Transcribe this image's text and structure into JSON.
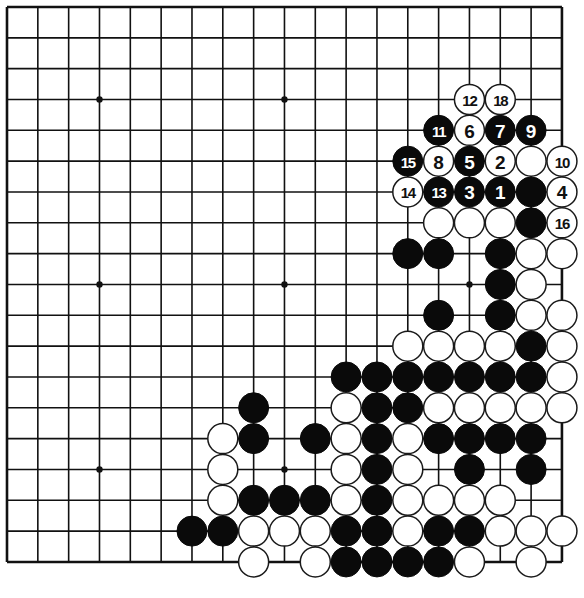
{
  "board": {
    "size": 19,
    "origin_x": 7,
    "origin_y": 7,
    "spacing": 30.83,
    "stone_radius": 15,
    "star_points": [
      [
        3,
        3
      ],
      [
        9,
        3
      ],
      [
        15,
        3
      ],
      [
        3,
        9
      ],
      [
        9,
        9
      ],
      [
        15,
        9
      ],
      [
        3,
        15
      ],
      [
        9,
        15
      ],
      [
        15,
        15
      ]
    ],
    "colors": {
      "line": "#111111",
      "black": "#0a0a0a",
      "white": "#ffffff"
    }
  },
  "numbered_moves": [
    {
      "n": "1",
      "color": "B",
      "col": 16,
      "row": 6
    },
    {
      "n": "2",
      "color": "W",
      "col": 16,
      "row": 5
    },
    {
      "n": "3",
      "color": "B",
      "col": 15,
      "row": 6
    },
    {
      "n": "4",
      "color": "W",
      "col": 18,
      "row": 6
    },
    {
      "n": "5",
      "color": "B",
      "col": 15,
      "row": 5
    },
    {
      "n": "6",
      "color": "W",
      "col": 15,
      "row": 4
    },
    {
      "n": "7",
      "color": "B",
      "col": 16,
      "row": 4
    },
    {
      "n": "8",
      "color": "W",
      "col": 14,
      "row": 5
    },
    {
      "n": "9",
      "color": "B",
      "col": 17,
      "row": 4
    },
    {
      "n": "10",
      "color": "W",
      "col": 18,
      "row": 5
    },
    {
      "n": "11",
      "color": "B",
      "col": 14,
      "row": 4
    },
    {
      "n": "12",
      "color": "W",
      "col": 15,
      "row": 3
    },
    {
      "n": "13",
      "color": "B",
      "col": 14,
      "row": 6
    },
    {
      "n": "14",
      "color": "W",
      "col": 13,
      "row": 6
    },
    {
      "n": "15",
      "color": "B",
      "col": 13,
      "row": 5
    },
    {
      "n": "16",
      "color": "W",
      "col": 18,
      "row": 7
    },
    {
      "n": "18",
      "color": "W",
      "col": 16,
      "row": 3
    }
  ],
  "stones": [
    {
      "color": "W",
      "col": 17,
      "row": 5
    },
    {
      "color": "B",
      "col": 17,
      "row": 6
    },
    {
      "color": "W",
      "col": 14,
      "row": 7
    },
    {
      "color": "W",
      "col": 15,
      "row": 7
    },
    {
      "color": "W",
      "col": 16,
      "row": 7
    },
    {
      "color": "B",
      "col": 17,
      "row": 7
    },
    {
      "color": "B",
      "col": 13,
      "row": 8
    },
    {
      "color": "B",
      "col": 14,
      "row": 8
    },
    {
      "color": "B",
      "col": 16,
      "row": 8
    },
    {
      "color": "W",
      "col": 17,
      "row": 8
    },
    {
      "color": "W",
      "col": 18,
      "row": 8
    },
    {
      "color": "B",
      "col": 16,
      "row": 9
    },
    {
      "color": "W",
      "col": 17,
      "row": 9
    },
    {
      "color": "B",
      "col": 14,
      "row": 10
    },
    {
      "color": "B",
      "col": 16,
      "row": 10
    },
    {
      "color": "W",
      "col": 17,
      "row": 10
    },
    {
      "color": "W",
      "col": 18,
      "row": 10
    },
    {
      "color": "W",
      "col": 13,
      "row": 11
    },
    {
      "color": "W",
      "col": 14,
      "row": 11
    },
    {
      "color": "W",
      "col": 15,
      "row": 11
    },
    {
      "color": "W",
      "col": 16,
      "row": 11
    },
    {
      "color": "B",
      "col": 17,
      "row": 11
    },
    {
      "color": "W",
      "col": 18,
      "row": 11
    },
    {
      "color": "B",
      "col": 11,
      "row": 12
    },
    {
      "color": "B",
      "col": 12,
      "row": 12
    },
    {
      "color": "B",
      "col": 13,
      "row": 12
    },
    {
      "color": "B",
      "col": 14,
      "row": 12
    },
    {
      "color": "B",
      "col": 15,
      "row": 12
    },
    {
      "color": "B",
      "col": 16,
      "row": 12
    },
    {
      "color": "B",
      "col": 17,
      "row": 12
    },
    {
      "color": "W",
      "col": 18,
      "row": 12
    },
    {
      "color": "B",
      "col": 8,
      "row": 13
    },
    {
      "color": "W",
      "col": 11,
      "row": 13
    },
    {
      "color": "B",
      "col": 12,
      "row": 13
    },
    {
      "color": "B",
      "col": 13,
      "row": 13
    },
    {
      "color": "W",
      "col": 14,
      "row": 13
    },
    {
      "color": "W",
      "col": 15,
      "row": 13
    },
    {
      "color": "W",
      "col": 16,
      "row": 13
    },
    {
      "color": "W",
      "col": 17,
      "row": 13
    },
    {
      "color": "W",
      "col": 18,
      "row": 13
    },
    {
      "color": "W",
      "col": 7,
      "row": 14
    },
    {
      "color": "B",
      "col": 8,
      "row": 14
    },
    {
      "color": "B",
      "col": 10,
      "row": 14
    },
    {
      "color": "W",
      "col": 11,
      "row": 14
    },
    {
      "color": "B",
      "col": 12,
      "row": 14
    },
    {
      "color": "W",
      "col": 13,
      "row": 14
    },
    {
      "color": "B",
      "col": 14,
      "row": 14
    },
    {
      "color": "B",
      "col": 15,
      "row": 14
    },
    {
      "color": "B",
      "col": 16,
      "row": 14
    },
    {
      "color": "B",
      "col": 17,
      "row": 14
    },
    {
      "color": "W",
      "col": 7,
      "row": 15
    },
    {
      "color": "W",
      "col": 11,
      "row": 15
    },
    {
      "color": "B",
      "col": 12,
      "row": 15
    },
    {
      "color": "W",
      "col": 13,
      "row": 15
    },
    {
      "color": "B",
      "col": 15,
      "row": 15
    },
    {
      "color": "B",
      "col": 17,
      "row": 15
    },
    {
      "color": "W",
      "col": 7,
      "row": 16
    },
    {
      "color": "B",
      "col": 8,
      "row": 16
    },
    {
      "color": "B",
      "col": 9,
      "row": 16
    },
    {
      "color": "B",
      "col": 10,
      "row": 16
    },
    {
      "color": "W",
      "col": 11,
      "row": 16
    },
    {
      "color": "B",
      "col": 12,
      "row": 16
    },
    {
      "color": "W",
      "col": 13,
      "row": 16
    },
    {
      "color": "W",
      "col": 14,
      "row": 16
    },
    {
      "color": "W",
      "col": 15,
      "row": 16
    },
    {
      "color": "W",
      "col": 16,
      "row": 16
    },
    {
      "color": "B",
      "col": 6,
      "row": 17
    },
    {
      "color": "B",
      "col": 7,
      "row": 17
    },
    {
      "color": "W",
      "col": 8,
      "row": 17
    },
    {
      "color": "W",
      "col": 9,
      "row": 17
    },
    {
      "color": "W",
      "col": 10,
      "row": 17
    },
    {
      "color": "B",
      "col": 11,
      "row": 17
    },
    {
      "color": "B",
      "col": 12,
      "row": 17
    },
    {
      "color": "W",
      "col": 13,
      "row": 17
    },
    {
      "color": "B",
      "col": 14,
      "row": 17
    },
    {
      "color": "B",
      "col": 15,
      "row": 17
    },
    {
      "color": "W",
      "col": 16,
      "row": 17
    },
    {
      "color": "W",
      "col": 17,
      "row": 17
    },
    {
      "color": "W",
      "col": 18,
      "row": 17
    },
    {
      "color": "W",
      "col": 8,
      "row": 18
    },
    {
      "color": "W",
      "col": 10,
      "row": 18
    },
    {
      "color": "B",
      "col": 11,
      "row": 18
    },
    {
      "color": "B",
      "col": 12,
      "row": 18
    },
    {
      "color": "B",
      "col": 13,
      "row": 18
    },
    {
      "color": "B",
      "col": 14,
      "row": 18
    },
    {
      "color": "W",
      "col": 15,
      "row": 18
    },
    {
      "color": "W",
      "col": 17,
      "row": 18
    }
  ]
}
